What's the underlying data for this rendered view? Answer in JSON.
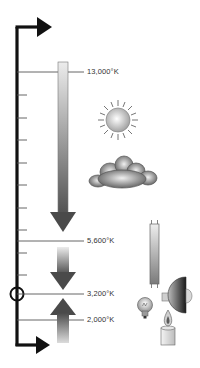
{
  "diagram": {
    "axis": {
      "direction": "vertical",
      "arrow_top": "right",
      "arrow_bottom": "right",
      "marker": "circle",
      "marker_at": "3,200°K"
    },
    "levels": [
      {
        "label": "13,000°K",
        "y": 72
      },
      {
        "label": "5,600°K",
        "y": 241
      },
      {
        "label": "3,200°K",
        "y": 294
      },
      {
        "label": "2,000°K",
        "y": 320
      }
    ],
    "arrows": [
      {
        "direction": "down",
        "from": "13,000°K",
        "to": "5,600°K"
      },
      {
        "direction": "down",
        "from": "5,600°K",
        "to": "3,200°K"
      },
      {
        "direction": "up",
        "from": "2,000°K",
        "to": "3,200°K"
      }
    ],
    "light_sources": [
      {
        "icon": "sun-icon",
        "name": "Sun"
      },
      {
        "icon": "cloud-icon",
        "name": "Overcast sky"
      },
      {
        "icon": "fluorescent-tube-icon",
        "name": "Fluorescent tube"
      },
      {
        "icon": "spotlight-icon",
        "name": "Tungsten lamp"
      },
      {
        "icon": "light-bulb-icon",
        "name": "Household bulb"
      },
      {
        "icon": "candle-icon",
        "name": "Candle"
      }
    ],
    "colors": {
      "axis": "#111111",
      "guide_line": "#555555",
      "arrow_dark": "#4a4a4a",
      "arrow_light": "#e6e6e6",
      "label": "#333333"
    }
  }
}
